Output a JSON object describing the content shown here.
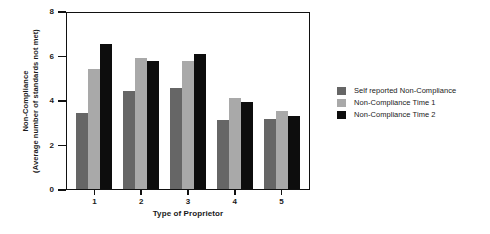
{
  "chart_data": {
    "type": "bar",
    "title": "",
    "xlabel": "Type of Proprietor",
    "ylabel": "Non-Compliance",
    "ylabel_line2": "(Average number of standards not met)",
    "categories": [
      "1",
      "2",
      "3",
      "4",
      "5"
    ],
    "series": [
      {
        "name": "Self reported Non-Compliance",
        "color": "#666666",
        "values": [
          3.4,
          4.4,
          4.55,
          3.1,
          3.15
        ]
      },
      {
        "name": "Non-Compliance Time 1",
        "color": "#a9a9a9",
        "values": [
          5.4,
          5.9,
          5.75,
          4.1,
          3.5
        ]
      },
      {
        "name": "Non-Compliance Time 2",
        "color": "#0d0d0d",
        "values": [
          6.5,
          5.75,
          6.05,
          3.9,
          3.3
        ]
      }
    ],
    "ylim": [
      0,
      8
    ],
    "yticks": [
      0,
      2,
      4,
      6,
      8
    ],
    "ytick_labels": [
      "0",
      "2",
      "4",
      "6",
      "8"
    ],
    "grid": false,
    "legend_position": "right"
  },
  "legend": {
    "entries": [
      "Self reported Non-Compliance",
      "Non-Compliance Time 1",
      "Non-Compliance Time 2"
    ]
  }
}
